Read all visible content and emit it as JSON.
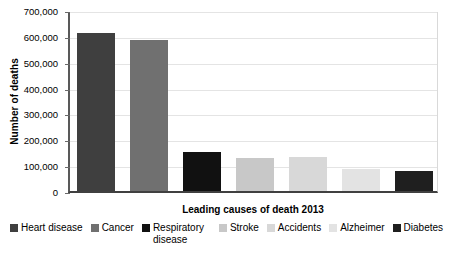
{
  "chart_data": {
    "type": "bar",
    "title": "",
    "xlabel": "Leading causes of death 2013",
    "ylabel": "Number of deaths",
    "categories": [
      "Heart disease",
      "Cancer",
      "Respiratory disease",
      "Stroke",
      "Accidents",
      "Alzheimer",
      "Diabetes"
    ],
    "values": [
      611000,
      585000,
      149000,
      129000,
      131000,
      85000,
      76000
    ],
    "ylim": [
      0,
      700000
    ],
    "ytick_labels": [
      "700,000",
      "600,000",
      "500,000",
      "400,000",
      "300,000",
      "200,000",
      "100,000",
      "0"
    ],
    "ytick_values": [
      700000,
      600000,
      500000,
      400000,
      300000,
      200000,
      100000,
      0
    ],
    "grid": true,
    "legend_position": "bottom",
    "colors": [
      "#3f3f3f",
      "#707070",
      "#111111",
      "#c8c8c8",
      "#d8d8d8",
      "#e3e3e3",
      "#1f1f1f"
    ]
  },
  "axes": {
    "y_title": "Number of deaths",
    "x_title": "Leading causes of death 2013"
  },
  "legend": {
    "items": [
      {
        "label": "Heart disease",
        "color": "#3f3f3f"
      },
      {
        "label": "Cancer",
        "color": "#707070"
      },
      {
        "label": "Respiratory disease",
        "color": "#111111"
      },
      {
        "label": "Stroke",
        "color": "#c8c8c8"
      },
      {
        "label": "Accidents",
        "color": "#d8d8d8"
      },
      {
        "label": "Alzheimer",
        "color": "#e3e3e3"
      },
      {
        "label": "Diabetes",
        "color": "#1f1f1f"
      }
    ]
  }
}
